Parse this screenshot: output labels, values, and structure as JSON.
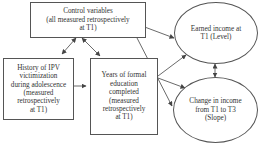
{
  "diagram": {
    "nodes": [
      {
        "id": "control",
        "shape": "rect",
        "label": "Control variables\n(all measured retrospectively\nat T1)"
      },
      {
        "id": "ipv",
        "shape": "rect",
        "label": "History of IPV\nvictimization\nduring adolescence\n(measured\nretrospectively\nat T1)"
      },
      {
        "id": "education",
        "shape": "rect",
        "label": "Years of formal\neducation\ncompleted\n(measured\nretrospectively\nat T1)"
      },
      {
        "id": "income_level",
        "shape": "ellipse",
        "label": "Earned income at\nT1 (Level)"
      },
      {
        "id": "income_slope",
        "shape": "ellipse",
        "label": "Change in income\nfrom T1 to T3\n(Slope)"
      }
    ],
    "edges": [
      {
        "from": "control",
        "to": "ipv",
        "type": "bidirectional"
      },
      {
        "from": "control",
        "to": "education",
        "type": "bidirectional"
      },
      {
        "from": "control",
        "to": "income_level",
        "type": "directed"
      },
      {
        "from": "control",
        "to": "income_slope",
        "type": "directed"
      },
      {
        "from": "ipv",
        "to": "education",
        "type": "directed"
      },
      {
        "from": "education",
        "to": "income_level",
        "type": "directed"
      },
      {
        "from": "education",
        "to": "income_slope",
        "type": "directed"
      },
      {
        "from": "income_level",
        "to": "income_slope",
        "type": "bidirectional"
      }
    ]
  }
}
